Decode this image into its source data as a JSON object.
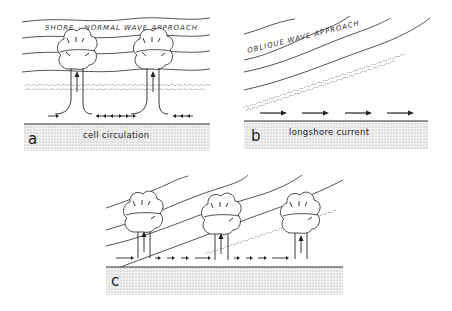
{
  "panels": [
    {
      "id": "a",
      "letter": "a",
      "title": "SHORE - NORMAL WAVE APPROACH",
      "caption": "cell circulation"
    },
    {
      "id": "b",
      "letter": "b",
      "title": "OBLIQUE WAVE APPROACH",
      "caption": "longshore current"
    },
    {
      "id": "c",
      "letter": "c",
      "title": "",
      "caption": ""
    }
  ],
  "colors": {
    "ink": "#222222",
    "stipple": "#9a9a9a",
    "background": "#ffffff"
  }
}
